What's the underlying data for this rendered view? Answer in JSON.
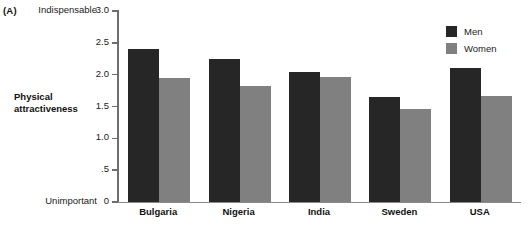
{
  "panel": {
    "tag": "(A)"
  },
  "axis": {
    "top_anchor": "Indispensable",
    "bottom_anchor": "Unimportant",
    "title_line1": "Physical",
    "title_line2": "attractiveness"
  },
  "legend": {
    "items": [
      {
        "label": "Men",
        "color": "#262626"
      },
      {
        "label": "Women",
        "color": "#808080"
      }
    ]
  },
  "chart_data": {
    "type": "bar",
    "title": "",
    "xlabel": "",
    "ylabel": "Physical attractiveness",
    "ylim": [
      0,
      3.0
    ],
    "yticks": [
      0,
      0.5,
      1.0,
      1.5,
      2.0,
      2.5,
      3.0
    ],
    "ytick_labels": [
      "0",
      ".5",
      "1.0",
      "1.5",
      "2.0",
      "2.5",
      "3.0"
    ],
    "grid": false,
    "legend_position": "top-right",
    "categories": [
      "Bulgaria",
      "Nigeria",
      "India",
      "Sweden",
      "USA"
    ],
    "series": [
      {
        "name": "Men",
        "color": "#262626",
        "values": [
          2.41,
          2.25,
          2.04,
          1.65,
          2.1
        ]
      },
      {
        "name": "Women",
        "color": "#808080",
        "values": [
          1.95,
          1.82,
          1.97,
          1.46,
          1.67
        ]
      }
    ]
  }
}
